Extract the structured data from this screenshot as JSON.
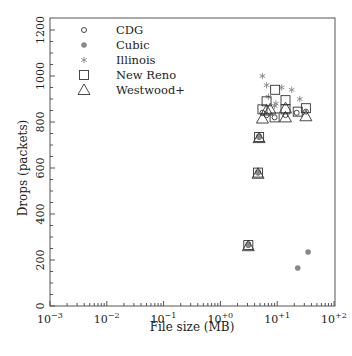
{
  "chart_data": {
    "type": "scatter",
    "title": "",
    "xlabel": "File size (MB)",
    "ylabel": "Drops (packets)",
    "xscale": "log",
    "xlim": [
      0.001,
      100
    ],
    "ylim": [
      0,
      1200
    ],
    "x_tick_labels": [
      "10−3",
      "10−2",
      "10−1",
      "10+0",
      "10+1",
      "10+2"
    ],
    "x_ticks": [
      0.001,
      0.01,
      0.1,
      1,
      10,
      100
    ],
    "y_ticks": [
      0,
      200,
      400,
      600,
      800,
      1000,
      1200
    ],
    "y_tick_labels": [
      "0",
      "200",
      "400",
      "600",
      "800",
      "1000",
      "1200"
    ],
    "grid": false,
    "legend_position": "upper-left",
    "legend": [
      "CDG",
      "Cubic",
      "Illinois",
      "New Reno",
      "Westwood+"
    ],
    "series": [
      {
        "name": "CDG",
        "marker": "circle",
        "points": [
          [
            3.1,
            265
          ],
          [
            4.6,
            580
          ],
          [
            4.8,
            735
          ],
          [
            5.5,
            840
          ],
          [
            6.5,
            830
          ],
          [
            9,
            820
          ],
          [
            14,
            830
          ],
          [
            22,
            840
          ],
          [
            32,
            845
          ]
        ]
      },
      {
        "name": "Cubic",
        "marker": "dot",
        "points": [
          [
            3.1,
            265
          ],
          [
            4.6,
            580
          ],
          [
            4.8,
            735
          ],
          [
            23,
            165
          ],
          [
            35,
            235
          ]
        ]
      },
      {
        "name": "Illinois",
        "marker": "star",
        "points": [
          [
            3.1,
            270
          ],
          [
            4.6,
            585
          ],
          [
            4.8,
            738
          ],
          [
            5.5,
            1000
          ],
          [
            6.5,
            960
          ],
          [
            7,
            910
          ],
          [
            9,
            870
          ],
          [
            12,
            950
          ],
          [
            18,
            940
          ],
          [
            25,
            900
          ],
          [
            9.5,
            880
          ]
        ]
      },
      {
        "name": "New Reno",
        "marker": "square",
        "points": [
          [
            3.1,
            265
          ],
          [
            4.6,
            580
          ],
          [
            4.8,
            735
          ],
          [
            5.5,
            855
          ],
          [
            6.5,
            890
          ],
          [
            9.2,
            940
          ],
          [
            9,
            820
          ],
          [
            14,
            895
          ],
          [
            14,
            855
          ],
          [
            23,
            845
          ],
          [
            32,
            860
          ]
        ]
      },
      {
        "name": "Westwood+",
        "marker": "triangle",
        "points": [
          [
            3.1,
            260
          ],
          [
            4.6,
            575
          ],
          [
            4.8,
            730
          ],
          [
            5.5,
            815
          ],
          [
            6.5,
            850
          ],
          [
            7.5,
            855
          ],
          [
            14,
            820
          ],
          [
            14,
            860
          ],
          [
            32,
            825
          ]
        ]
      }
    ]
  },
  "colors": {
    "axis": "#555555",
    "marker": "#333333",
    "dot": "#888888",
    "star": "#888888"
  }
}
